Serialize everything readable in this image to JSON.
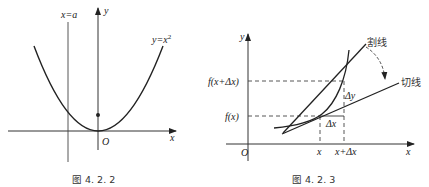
{
  "figures": [
    {
      "caption": "图 4. 2. 2",
      "labels": {
        "line": "x=a",
        "y_axis": "y",
        "x_axis": "x",
        "origin": "O",
        "curve": "y=x",
        "curve_exp": "2"
      }
    },
    {
      "caption": "图 4. 2. 3",
      "labels": {
        "y_axis": "y",
        "x_axis": "x",
        "origin": "O",
        "f_x_dx": "f(x+Δx)",
        "f_x": "f(x)",
        "x_tick": "x",
        "x_dx_tick": "x+Δx",
        "delta_y": "Δy",
        "delta_x": "Δx",
        "secant": "割线",
        "tangent": "切线"
      }
    }
  ]
}
